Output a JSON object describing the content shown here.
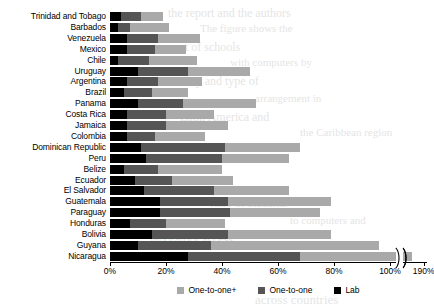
{
  "chart_data": {
    "type": "bar",
    "orientation": "horizontal",
    "stacked": true,
    "title": "",
    "subtitle": "",
    "xlabel": "",
    "ylabel": "",
    "grid": false,
    "legend_position": "bottom",
    "xlim": [
      0,
      100
    ],
    "axis_break": {
      "present": true,
      "after_tick": "100%",
      "resume_tick": "190%"
    },
    "xticks": [
      {
        "value": 0,
        "label": "0%"
      },
      {
        "value": 20,
        "label": "20%"
      },
      {
        "value": 40,
        "label": "40%"
      },
      {
        "value": 60,
        "label": "60%"
      },
      {
        "value": 80,
        "label": "80%"
      },
      {
        "value": 100,
        "label": "100%"
      },
      {
        "value": 112,
        "label": "190%"
      }
    ],
    "series": [
      {
        "name": "One-to-one+",
        "key": "oneplus",
        "color": "#a9a9a9"
      },
      {
        "name": "One-to-one",
        "key": "one",
        "color": "#555555"
      },
      {
        "name": "Lab",
        "key": "lab",
        "color": "#000000"
      }
    ],
    "categories": [
      "Trinidad and Tobago",
      "Barbados",
      "Venezuela",
      "Mexico",
      "Chile",
      "Uruguay",
      "Argentina",
      "Brazil",
      "Panama",
      "Costa Rica",
      "Jamaica",
      "Colombia",
      "Dominican Republic",
      "Peru",
      "Belize",
      "Ecuador",
      "El Salvador",
      "Guatemala",
      "Paraguay",
      "Honduras",
      "Bolivia",
      "Guyana",
      "Nicaragua"
    ],
    "rows": [
      {
        "category": "Trinidad and Tobago",
        "lab": 4,
        "one": 7,
        "oneplus": 8,
        "total": 19
      },
      {
        "category": "Barbados",
        "lab": 3,
        "one": 4,
        "oneplus": 14,
        "total": 21
      },
      {
        "category": "Venezuela",
        "lab": 6,
        "one": 11,
        "oneplus": 15,
        "total": 32
      },
      {
        "category": "Mexico",
        "lab": 6,
        "one": 10,
        "oneplus": 11,
        "total": 27
      },
      {
        "category": "Chile",
        "lab": 3,
        "one": 11,
        "oneplus": 17,
        "total": 31
      },
      {
        "category": "Uruguay",
        "lab": 10,
        "one": 18,
        "oneplus": 22,
        "total": 50
      },
      {
        "category": "Argentina",
        "lab": 6,
        "one": 11,
        "oneplus": 16,
        "total": 33
      },
      {
        "category": "Brazil",
        "lab": 5,
        "one": 10,
        "oneplus": 13,
        "total": 28
      },
      {
        "category": "Panama",
        "lab": 10,
        "one": 16,
        "oneplus": 26,
        "total": 52
      },
      {
        "category": "Costa Rica",
        "lab": 6,
        "one": 14,
        "oneplus": 17,
        "total": 37
      },
      {
        "category": "Jamaica",
        "lab": 6,
        "one": 14,
        "oneplus": 22,
        "total": 42
      },
      {
        "category": "Colombia",
        "lab": 6,
        "one": 10,
        "oneplus": 18,
        "total": 34
      },
      {
        "category": "Dominican Republic",
        "lab": 11,
        "one": 30,
        "oneplus": 27,
        "total": 68
      },
      {
        "category": "Peru",
        "lab": 13,
        "one": 27,
        "oneplus": 24,
        "total": 64
      },
      {
        "category": "Belize",
        "lab": 5,
        "one": 12,
        "oneplus": 23,
        "total": 40
      },
      {
        "category": "Ecuador",
        "lab": 9,
        "one": 13,
        "oneplus": 22,
        "total": 44
      },
      {
        "category": "El Salvador",
        "lab": 12,
        "one": 25,
        "oneplus": 27,
        "total": 64
      },
      {
        "category": "Guatemala",
        "lab": 18,
        "one": 24,
        "oneplus": 37,
        "total": 79
      },
      {
        "category": "Paraguay",
        "lab": 18,
        "one": 25,
        "oneplus": 32,
        "total": 75
      },
      {
        "category": "Honduras",
        "lab": 7,
        "one": 13,
        "oneplus": 21,
        "total": 41
      },
      {
        "category": "Bolivia",
        "lab": 15,
        "one": 27,
        "oneplus": 37,
        "total": 79
      },
      {
        "category": "Guyana",
        "lab": 10,
        "one": 26,
        "oneplus": 60,
        "total": 96
      },
      {
        "category": "Nicaragua",
        "lab": 28,
        "one": 40,
        "oneplus": 122,
        "total": 190
      }
    ]
  },
  "legend": {
    "items": [
      {
        "label": "One-to-one+"
      },
      {
        "label": "One-to-one"
      },
      {
        "label": "Lab"
      }
    ]
  },
  "background_text": {
    "lines": [
      "the report and the authors",
      "The figure shows the",
      "per cent of schools",
      "with computers by",
      "country and type of",
      "arrangement in",
      "Latin America and",
      "the Caribbean region",
      "ratio of students",
      "to computers and",
      "laboratory access",
      "across countries"
    ]
  }
}
